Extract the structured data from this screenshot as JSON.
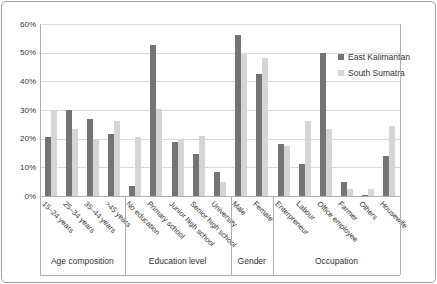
{
  "colors": {
    "east_kalimantan": "#747474",
    "south_sumatra": "#d5d5d5",
    "gridline": "#d9d9d9",
    "axis_line": "#aeaeae",
    "text": "#333333",
    "frame_border": "#9d9d9d"
  },
  "legend": {
    "entries": [
      {
        "label": "East Kalimantan",
        "color": "#747474"
      },
      {
        "label": "South Sumatra",
        "color": "#d5d5d5"
      }
    ]
  },
  "chart_data": {
    "type": "bar",
    "unit": "%",
    "ylim": [
      0,
      60
    ],
    "ytick_step": 10,
    "ytick_labels": [
      "0%",
      "10%",
      "20%",
      "30%",
      "40%",
      "50%",
      "60%"
    ],
    "grid": true,
    "legend_position": "right-top-overlay",
    "groups": [
      {
        "label": "Age composition",
        "categories": [
          "15–24 years",
          "25–34 years",
          "35–44 years",
          ">45 years"
        ]
      },
      {
        "label": "Education level",
        "categories": [
          "No education",
          "Primary school",
          "Junior high school",
          "Senior high school",
          "University"
        ]
      },
      {
        "label": "Gender",
        "categories": [
          "Male",
          "Female"
        ]
      },
      {
        "label": "Occupation",
        "categories": [
          "Enterpreneur",
          "Labour",
          "Office employee",
          "Farmer",
          "Others",
          "Housewife"
        ]
      }
    ],
    "series": [
      {
        "name": "East Kalimantan",
        "color": "#747474",
        "values": [
          20.5,
          30,
          27,
          21.5,
          3.5,
          52.5,
          19,
          14.5,
          8.5,
          56,
          42.5,
          18,
          11,
          50,
          5,
          0.5,
          14
        ]
      },
      {
        "name": "South Sumatra",
        "color": "#d5d5d5",
        "values": [
          30,
          23.5,
          20,
          26,
          20.5,
          30.5,
          19.5,
          21,
          5,
          49.5,
          48,
          17.5,
          26,
          23.5,
          2.5,
          2.5,
          24.5
        ]
      }
    ]
  }
}
